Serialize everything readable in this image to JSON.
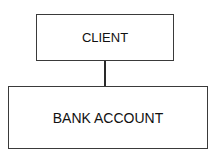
{
  "diagram": {
    "nodes": [
      {
        "id": "client",
        "label": "CLIENT"
      },
      {
        "id": "bank_account",
        "label": "BANK ACCOUNT"
      }
    ],
    "edges": [
      {
        "from": "client",
        "to": "bank_account"
      }
    ]
  }
}
